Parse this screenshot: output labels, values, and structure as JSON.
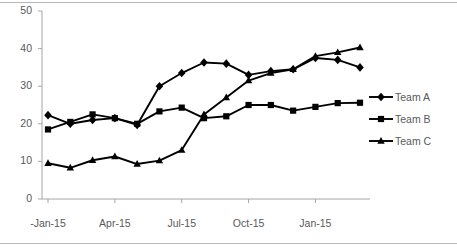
{
  "chart_data": {
    "type": "line",
    "title": "",
    "xlabel": "",
    "ylabel": "",
    "categories": [
      "-Jan-15",
      "Feb-15",
      "Mar-15",
      "Apr-15",
      "May-15",
      "Jun-15",
      "Jul-15",
      "Aug-15",
      "Sep-15",
      "Oct-15",
      "Nov-15",
      "Dec-15",
      "Jan-15",
      "Feb-16",
      "Mar-16"
    ],
    "xtick_labels": [
      "-Jan-15",
      "Apr-15",
      "Jul-15",
      "Oct-15",
      "Jan-15"
    ],
    "xtick_indices": [
      0,
      3,
      6,
      9,
      12
    ],
    "ytick_labels": [
      "0",
      "10",
      "20",
      "30",
      "40",
      "50"
    ],
    "ytick_values": [
      0,
      10,
      20,
      30,
      40,
      50
    ],
    "ylim": [
      0,
      50
    ],
    "grid": false,
    "legend_position": "right",
    "series": [
      {
        "name": "Team A",
        "marker": "diamond",
        "color": "#000000",
        "values": [
          22.3,
          20.0,
          21.0,
          21.5,
          19.7,
          30.0,
          33.5,
          36.3,
          36.0,
          33.0,
          34.0,
          34.5,
          37.5,
          37.0,
          35.0
        ]
      },
      {
        "name": "Team B",
        "marker": "square",
        "color": "#000000",
        "values": [
          18.5,
          20.5,
          22.5,
          21.5,
          20.0,
          23.3,
          24.3,
          21.5,
          22.0,
          25.0,
          25.0,
          23.5,
          24.5,
          25.5,
          25.6
        ]
      },
      {
        "name": "Team C",
        "marker": "triangle",
        "color": "#000000",
        "values": [
          9.5,
          8.3,
          10.3,
          11.3,
          9.3,
          10.2,
          13.0,
          22.5,
          27.0,
          31.5,
          33.5,
          34.5,
          38.0,
          39.0,
          40.3
        ]
      }
    ]
  },
  "legend": {
    "items": [
      {
        "label": "Team A",
        "marker": "diamond"
      },
      {
        "label": "Team B",
        "marker": "square"
      },
      {
        "label": "Team C",
        "marker": "triangle"
      }
    ]
  },
  "axis": {
    "line_color": "#a6a6a6",
    "text_color": "#595959"
  }
}
